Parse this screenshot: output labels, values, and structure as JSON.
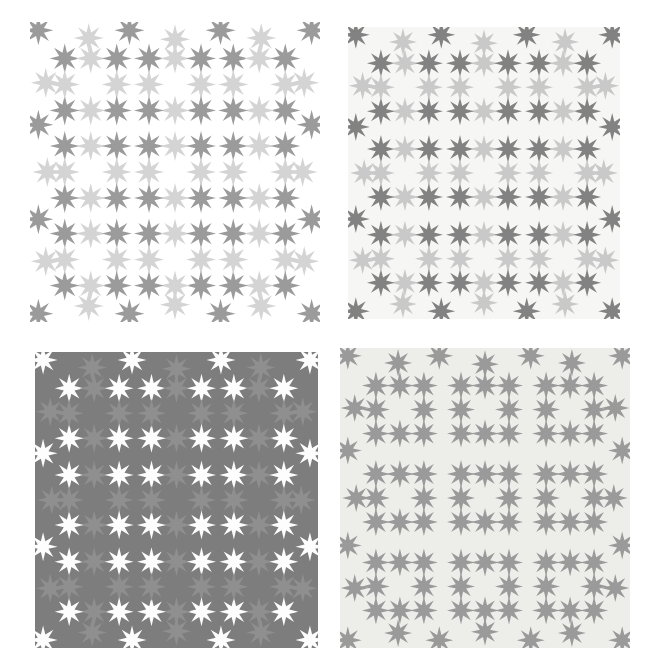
{
  "figure": {
    "width": 656,
    "height": 669,
    "page_background": "#ffffff",
    "layout": "2x2 panel grid"
  },
  "chart_data": {
    "type": "scatter",
    "xlabel": "",
    "ylabel": "",
    "grid": false,
    "legend": "none",
    "panel_layout": {
      "rows": 2,
      "cols": 2,
      "rings_per_panel": 9,
      "ring_rows": 3,
      "ring_cols": 3,
      "stars_per_ring": 8,
      "star_points": 8
    },
    "panels": [
      {
        "id": "panel-top-left",
        "position": "top-left",
        "bbox": [
          30,
          22,
          290,
          300
        ],
        "background": "#ffffff",
        "background_visible": false,
        "corner_star_color": "#9b9b9b",
        "edge_star_color": "#d4d4d4",
        "perimeter_corner_color": "#9b9b9b",
        "perimeter_edge_color": "#d4d4d4",
        "star_size": 30,
        "ring_radius": 26,
        "has_outer_ring": true
      },
      {
        "id": "panel-top-right",
        "position": "top-right",
        "bbox": [
          348,
          27,
          272,
          292
        ],
        "background": "#f6f6f4",
        "background_visible": true,
        "corner_star_color": "#828282",
        "edge_star_color": "#c9c9c9",
        "perimeter_corner_color": "#828282",
        "perimeter_edge_color": "#c9c9c9",
        "star_size": 28,
        "ring_radius": 24,
        "has_outer_ring": true
      },
      {
        "id": "panel-bottom-left",
        "position": "bottom-left",
        "bbox": [
          35,
          352,
          283,
          296
        ],
        "background": "#7d7d7d",
        "background_visible": true,
        "corner_star_color": "#fdfdfd",
        "edge_star_color": "#8f8f8f",
        "perimeter_corner_color": "#fdfdfd",
        "perimeter_edge_color": "#8f8f8f",
        "star_size": 29,
        "ring_radius": 25,
        "has_outer_ring": true
      },
      {
        "id": "panel-bottom-right",
        "position": "bottom-right",
        "bbox": [
          340,
          348,
          290,
          300
        ],
        "background": "#ededea",
        "background_visible": true,
        "corner_star_color": "#9a9a9a",
        "edge_star_color": "#9a9a9a",
        "perimeter_corner_color": "#9a9a9a",
        "perimeter_edge_color": "#9a9a9a",
        "star_size": 28,
        "ring_radius": 24,
        "has_outer_ring": true
      }
    ],
    "ring_centers_normalized": [
      [
        0.5,
        0.5
      ],
      [
        1.5,
        0.5
      ],
      [
        2.5,
        0.5
      ],
      [
        0.5,
        1.5
      ],
      [
        1.5,
        1.5
      ],
      [
        2.5,
        1.5
      ],
      [
        0.5,
        2.5
      ],
      [
        1.5,
        2.5
      ],
      [
        2.5,
        2.5
      ]
    ],
    "star_offsets_in_ring": [
      {
        "role": "corner",
        "dx": -1,
        "dy": -1
      },
      {
        "role": "edge",
        "dx": 0,
        "dy": -1
      },
      {
        "role": "corner",
        "dx": 1,
        "dy": -1
      },
      {
        "role": "edge",
        "dx": 1,
        "dy": 0
      },
      {
        "role": "corner",
        "dx": 1,
        "dy": 1
      },
      {
        "role": "edge",
        "dx": 0,
        "dy": 1
      },
      {
        "role": "corner",
        "dx": -1,
        "dy": 1
      },
      {
        "role": "edge",
        "dx": -1,
        "dy": 0
      }
    ],
    "values": [
      1,
      1,
      1,
      1
    ],
    "categories": [
      "top-left",
      "top-right",
      "bottom-left",
      "bottom-right"
    ]
  }
}
